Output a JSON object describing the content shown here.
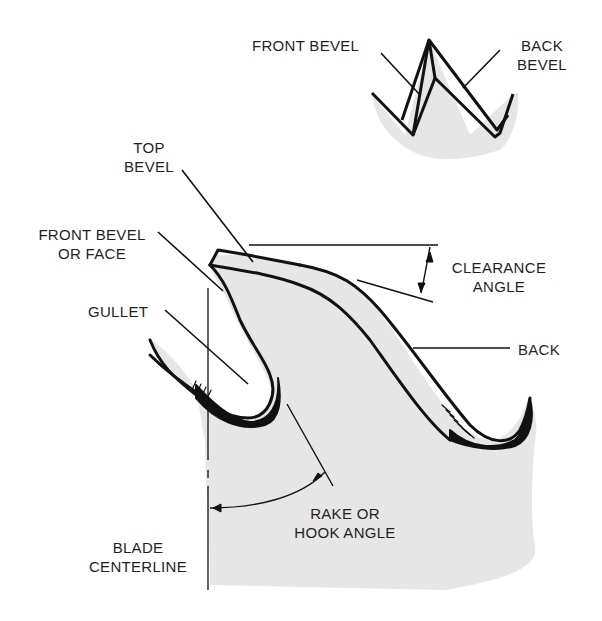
{
  "diagram": {
    "type": "saw-tooth-anatomy",
    "colors": {
      "blade_fill": "#e6e6e6",
      "outline": "#111111",
      "text": "#1f1f1f",
      "background": "#ffffff"
    },
    "inset_labels": {
      "front_bevel": "FRONT BEVEL",
      "back_bevel_line1": "BACK",
      "back_bevel_line2": "BEVEL"
    },
    "labels": {
      "top_bevel_line1": "TOP",
      "top_bevel_line2": "BEVEL",
      "front_bevel_face_line1": "FRONT BEVEL",
      "front_bevel_face_line2": "OR FACE",
      "gullet": "GULLET",
      "clearance_angle_line1": "CLEARANCE",
      "clearance_angle_line2": "ANGLE",
      "back": "BACK",
      "rake_angle_line1": "RAKE OR",
      "rake_angle_line2": "HOOK ANGLE",
      "blade_centerline_line1": "BLADE",
      "blade_centerline_line2": "CENTERLINE"
    }
  }
}
